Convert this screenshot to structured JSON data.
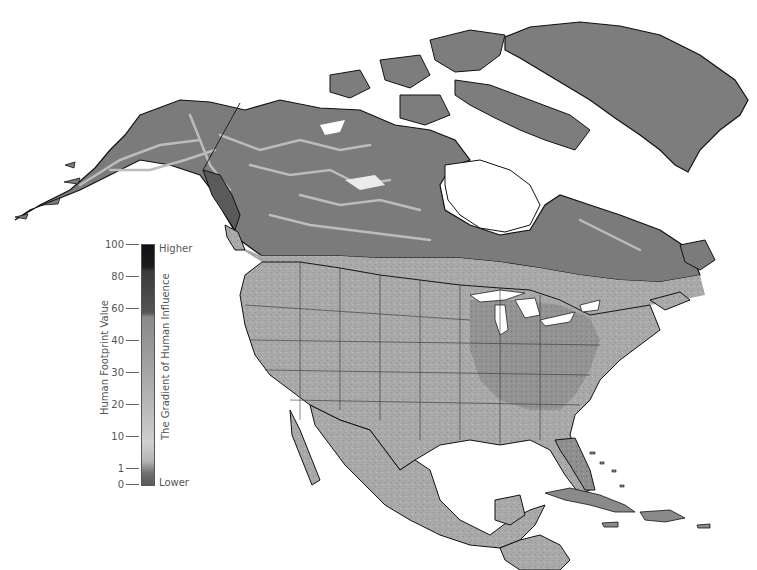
{
  "map": {
    "region": "North America",
    "projection_style": "Lambert conformal (curved)",
    "colors": {
      "water": "#ffffff",
      "land_low": "#7a7a7a",
      "land_mid": "#b8b8b8",
      "land_high": "#1a1a1a",
      "coastline": "#111111",
      "borders": "#333333"
    },
    "features": [
      "Alaska",
      "Canada",
      "Greenland",
      "United States",
      "Mexico",
      "Central America",
      "Cuba",
      "Hispaniola",
      "Jamaica",
      "Bahamas",
      "Hudson Bay",
      "Great Lakes"
    ]
  },
  "legend": {
    "axis_label": "Human Footprint Value",
    "gradient_label": "The Gradient of Human Influence",
    "high_label": "Higher",
    "low_label": "Lower",
    "ticks": [
      "100",
      "80",
      "60",
      "40",
      "30",
      "20",
      "10",
      "1",
      "0"
    ]
  }
}
